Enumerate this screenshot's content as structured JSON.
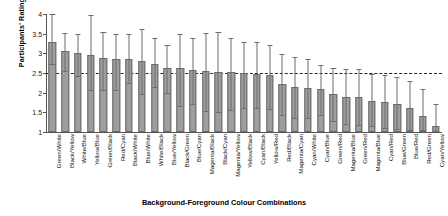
{
  "chart_data": {
    "type": "bar",
    "title": "",
    "xlabel": "Background-Foreground Colour Combinations",
    "ylabel": "Participants' Ratings",
    "ylim": [
      1,
      4
    ],
    "yticks": [
      1,
      1.5,
      2,
      2.5,
      3,
      3.5,
      4
    ],
    "ytick_labels": [
      "1",
      "1.5",
      "2",
      "2.5",
      "3",
      "3.5",
      "4"
    ],
    "grid": false,
    "legend": null,
    "reference_line": {
      "value": 2.5,
      "style": "dash-dot"
    },
    "error_bars": "upper and lower whiskers",
    "categories": [
      "Green/White",
      "Black/Yellow",
      "White/Blue",
      "Yellow/Blue",
      "Green/Black",
      "Red/Cyan",
      "Black/White",
      "Blue/White",
      "White/Black",
      "Blue/Yellow",
      "Black/Green",
      "Blue/Cyan",
      "Magenta/Black",
      "Black/Cyan",
      "Magenta/Yellow",
      "Yellow/Black",
      "Cyan/Black",
      "Yellow/Red",
      "Red/Black",
      "Magenta/Cyan",
      "Cyan/White",
      "Cyan/Blue",
      "Green/Red",
      "Magenta/Blue",
      "Green/Red",
      "Magenta/Blue",
      "Cyan/Red",
      "Blue/Green",
      "Blue/Red",
      "Red/Green",
      "Cyan/Yellow"
    ],
    "values": [
      3.3,
      3.06,
      3.01,
      2.97,
      2.89,
      2.85,
      2.85,
      2.8,
      2.73,
      2.62,
      2.62,
      2.58,
      2.54,
      2.52,
      2.52,
      2.5,
      2.48,
      2.44,
      2.22,
      2.14,
      2.12,
      2.1,
      1.96,
      1.9,
      1.88,
      1.8,
      1.76,
      1.7,
      1.62,
      1.4,
      1.15
    ],
    "upper_errors": [
      4.0,
      3.52,
      3.5,
      3.97,
      3.53,
      3.5,
      3.5,
      3.62,
      3.4,
      3.2,
      3.5,
      3.4,
      3.52,
      3.55,
      3.4,
      3.3,
      3.3,
      3.2,
      2.98,
      2.9,
      2.86,
      2.7,
      2.62,
      2.6,
      2.6,
      2.48,
      2.44,
      2.4,
      2.3,
      2.1,
      1.7
    ],
    "lower_errors": [
      2.72,
      2.54,
      2.42,
      2.06,
      2.08,
      2.08,
      2.24,
      1.96,
      2.14,
      1.98,
      1.66,
      1.7,
      1.54,
      1.52,
      1.56,
      1.6,
      1.62,
      1.58,
      1.42,
      1.36,
      1.36,
      1.44,
      1.28,
      1.2,
      1.18,
      1.14,
      1.1,
      1.08,
      1.06,
      1.04,
      1.02
    ]
  }
}
